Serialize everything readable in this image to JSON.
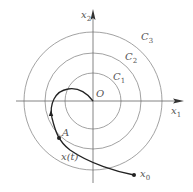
{
  "figure": {
    "axes": {
      "x_label": "x",
      "x_sub": "1",
      "y_label": "x",
      "y_sub": "2",
      "origin_label": "O"
    },
    "circles": [
      {
        "label": "C",
        "sub": "1"
      },
      {
        "label": "C",
        "sub": "2"
      },
      {
        "label": "C",
        "sub": "3"
      }
    ],
    "trajectory": {
      "label": "x(t)",
      "start_label": "x",
      "start_sub": "0",
      "point_label": "A"
    },
    "colors": {
      "axis": "#555555",
      "circle": "#777777",
      "curve": "#222222"
    }
  }
}
